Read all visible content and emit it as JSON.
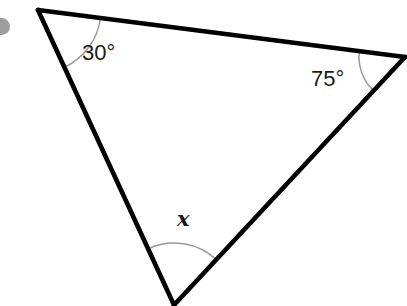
{
  "figure": {
    "kind": "triangle-angle-diagram",
    "width": 407,
    "height": 306,
    "background_color": "#ffffff",
    "edge_color": "#000000",
    "edge_width": 4.6,
    "arc_color": "#9a9a9a",
    "arc_width": 1.5,
    "label_color": "#1a1a1a",
    "artifact_color": "#9d9d9d"
  },
  "chart_data": {
    "type": "diagram",
    "title": "",
    "shape": "triangle",
    "vertices": [
      {
        "id": "A",
        "x": 38,
        "y": 10,
        "angle_label": "30°",
        "angle_value": 30,
        "known": true
      },
      {
        "id": "B",
        "x": 405,
        "y": 57,
        "angle_label": "75°",
        "angle_value": 75,
        "known": true
      },
      {
        "id": "C",
        "x": 174,
        "y": 305,
        "angle_label": "x",
        "angle_value": null,
        "known": false
      }
    ],
    "edges": [
      {
        "from": "A",
        "to": "B"
      },
      {
        "from": "B",
        "to": "C"
      },
      {
        "from": "C",
        "to": "A"
      }
    ],
    "arcs": [
      {
        "vertex": "A",
        "radius": 63,
        "label": "30°"
      },
      {
        "vertex": "B",
        "radius": 46,
        "label": "75°"
      },
      {
        "vertex": "C",
        "radius": 62,
        "label": "x"
      }
    ],
    "annotations": [
      "30°",
      "75°",
      "x"
    ]
  },
  "labels": {
    "angle_a": "30°",
    "angle_b": "75°",
    "angle_c": "x"
  }
}
